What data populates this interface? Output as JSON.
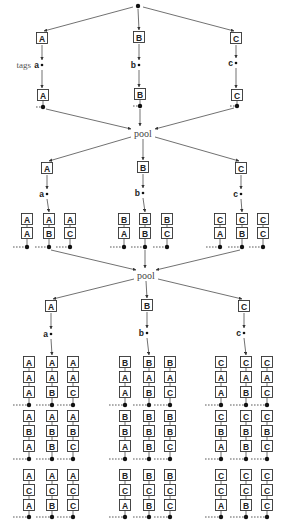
{
  "diagram": {
    "title_labels": {
      "tags": "tags",
      "pool": "pool"
    },
    "root_dot": {
      "x": 138,
      "y": 6
    },
    "stage1": {
      "branches": [
        {
          "letter": "A",
          "tag": "a",
          "x": 42,
          "top_y": 38,
          "tag_y": 65,
          "bottom_y": 95,
          "dot_y": 107
        },
        {
          "letter": "B",
          "tag": "b",
          "x": 139,
          "top_y": 37,
          "tag_y": 65,
          "bottom_y": 94,
          "dot_y": 106
        },
        {
          "letter": "C",
          "tag": "c",
          "x": 236,
          "top_y": 38,
          "tag_y": 63,
          "bottom_y": 95,
          "dot_y": 106
        }
      ],
      "pool": {
        "x": 143,
        "y": 133
      }
    },
    "stage2": {
      "branches": [
        {
          "letter": "A",
          "tag": "a",
          "x": 47,
          "top_y": 168,
          "tag_y": 194,
          "columns": [
            {
              "x": 27,
              "stack": [
                "A",
                "A"
              ]
            },
            {
              "x": 49,
              "stack": [
                "A",
                "B"
              ]
            },
            {
              "x": 70,
              "stack": [
                "A",
                "C"
              ]
            }
          ]
        },
        {
          "letter": "B",
          "tag": "b",
          "x": 143,
          "top_y": 167,
          "tag_y": 193,
          "columns": [
            {
              "x": 124,
              "stack": [
                "B",
                "A"
              ]
            },
            {
              "x": 145,
              "stack": [
                "B",
                "B"
              ]
            },
            {
              "x": 167,
              "stack": [
                "B",
                "C"
              ]
            }
          ]
        },
        {
          "letter": "C",
          "tag": "c",
          "x": 241,
          "top_y": 168,
          "tag_y": 194,
          "columns": [
            {
              "x": 220,
              "stack": [
                "C",
                "A"
              ]
            },
            {
              "x": 242,
              "stack": [
                "C",
                "B"
              ]
            },
            {
              "x": 263,
              "stack": [
                "C",
                "C"
              ]
            }
          ]
        }
      ],
      "row_y": [
        219,
        233
      ],
      "dot_y": 247,
      "pool": {
        "x": 146,
        "y": 275
      }
    },
    "stage3": {
      "branches": [
        {
          "letter": "A",
          "tag": "a",
          "x": 51,
          "top_y": 306,
          "tag_y": 334,
          "groups": [
            [
              {
                "x": 29,
                "stack": [
                  "A",
                  "A",
                  "A"
                ]
              },
              {
                "x": 52,
                "stack": [
                  "A",
                  "A",
                  "B"
                ]
              },
              {
                "x": 73,
                "stack": [
                  "A",
                  "A",
                  "C"
                ]
              }
            ],
            [
              {
                "x": 29,
                "stack": [
                  "A",
                  "B",
                  "A"
                ]
              },
              {
                "x": 52,
                "stack": [
                  "A",
                  "B",
                  "B"
                ]
              },
              {
                "x": 73,
                "stack": [
                  "A",
                  "B",
                  "C"
                ]
              }
            ],
            [
              {
                "x": 29,
                "stack": [
                  "A",
                  "C",
                  "A"
                ]
              },
              {
                "x": 52,
                "stack": [
                  "A",
                  "C",
                  "B"
                ]
              },
              {
                "x": 73,
                "stack": [
                  "A",
                  "C",
                  "C"
                ]
              }
            ]
          ]
        },
        {
          "letter": "B",
          "tag": "b",
          "x": 147,
          "top_y": 305,
          "tag_y": 333,
          "groups": [
            [
              {
                "x": 125,
                "stack": [
                  "B",
                  "A",
                  "A"
                ]
              },
              {
                "x": 149,
                "stack": [
                  "B",
                  "A",
                  "B"
                ]
              },
              {
                "x": 170,
                "stack": [
                  "B",
                  "A",
                  "C"
                ]
              }
            ],
            [
              {
                "x": 125,
                "stack": [
                  "B",
                  "B",
                  "A"
                ]
              },
              {
                "x": 149,
                "stack": [
                  "B",
                  "B",
                  "B"
                ]
              },
              {
                "x": 170,
                "stack": [
                  "B",
                  "B",
                  "C"
                ]
              }
            ],
            [
              {
                "x": 125,
                "stack": [
                  "B",
                  "C",
                  "A"
                ]
              },
              {
                "x": 149,
                "stack": [
                  "B",
                  "C",
                  "B"
                ]
              },
              {
                "x": 170,
                "stack": [
                  "B",
                  "C",
                  "C"
                ]
              }
            ]
          ]
        },
        {
          "letter": "C",
          "tag": "c",
          "x": 244,
          "top_y": 306,
          "tag_y": 333,
          "groups": [
            [
              {
                "x": 221,
                "stack": [
                  "C",
                  "A",
                  "A"
                ]
              },
              {
                "x": 246,
                "stack": [
                  "C",
                  "A",
                  "B"
                ]
              },
              {
                "x": 267,
                "stack": [
                  "C",
                  "A",
                  "C"
                ]
              }
            ],
            [
              {
                "x": 221,
                "stack": [
                  "C",
                  "B",
                  "A"
                ]
              },
              {
                "x": 246,
                "stack": [
                  "C",
                  "B",
                  "B"
                ]
              },
              {
                "x": 267,
                "stack": [
                  "C",
                  "B",
                  "C"
                ]
              }
            ],
            [
              {
                "x": 221,
                "stack": [
                  "C",
                  "C",
                  "A"
                ]
              },
              {
                "x": 246,
                "stack": [
                  "C",
                  "C",
                  "B"
                ]
              },
              {
                "x": 267,
                "stack": [
                  "C",
                  "C",
                  "C"
                ]
              }
            ]
          ]
        }
      ],
      "group_rows": [
        {
          "row_y": [
            362,
            377,
            392
          ],
          "dot_y": 405
        },
        {
          "row_y": [
            416,
            431,
            446
          ],
          "dot_y": 459
        },
        {
          "row_y": [
            475,
            490,
            505
          ],
          "dot_y": 517
        }
      ]
    }
  }
}
